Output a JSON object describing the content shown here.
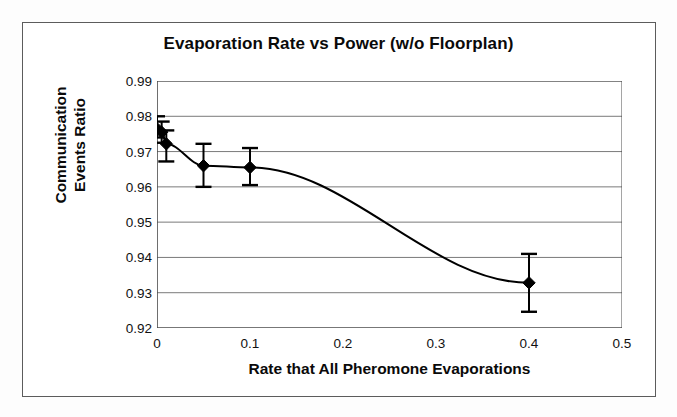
{
  "figure": {
    "title": "Evaporation Rate vs Power (w/o Floorplan)",
    "border_color": "#5c5c5c",
    "background": "#ffffff"
  },
  "axes": {
    "y_title_line1": "Communication",
    "y_title_line2": "Events Ratio",
    "x_title": "Rate that All Pheromone Evaporations",
    "y_ticks": [
      "0.99",
      "0.98",
      "0.97",
      "0.96",
      "0.95",
      "0.94",
      "0.93",
      "0.92"
    ],
    "x_ticks": [
      "0",
      "0.1",
      "0.2",
      "0.3",
      "0.4",
      "0.5"
    ]
  },
  "chart_data": {
    "type": "line",
    "title": "Evaporation Rate vs Power (w/o Floorplan)",
    "xlabel": "Rate that All Pheromone Evaporations",
    "ylabel": "Communication Events Ratio",
    "xlim": [
      0,
      0.5
    ],
    "ylim": [
      0.92,
      0.99
    ],
    "xticks": [
      0,
      0.1,
      0.2,
      0.3,
      0.4,
      0.5
    ],
    "yticks": [
      0.92,
      0.93,
      0.94,
      0.95,
      0.96,
      0.97,
      0.98,
      0.99
    ],
    "grid": "horizontal",
    "legend": "none",
    "marker": "filled-diamond",
    "error_bars": "vertical-with-caps",
    "line_color": "#000000",
    "marker_color": "#000000",
    "series": [
      {
        "name": "Communication Events Ratio",
        "x": [
          0.0,
          0.005,
          0.01,
          0.05,
          0.1,
          0.4
        ],
        "y": [
          0.9765,
          0.9755,
          0.9722,
          0.966,
          0.9655,
          0.9328
        ],
        "yerr_low": [
          0.0025,
          0.003,
          0.005,
          0.006,
          0.005,
          0.0082
        ],
        "yerr_high": [
          0.0035,
          0.003,
          0.0038,
          0.0062,
          0.0055,
          0.0082
        ]
      }
    ]
  }
}
